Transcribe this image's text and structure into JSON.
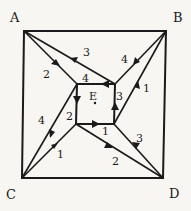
{
  "diagram": {
    "vertices": {
      "A": {
        "label": "A",
        "x": 24,
        "y": 31,
        "label_x": 10,
        "label_y": 22
      },
      "B": {
        "label": "B",
        "x": 166,
        "y": 31,
        "label_x": 173,
        "label_y": 22
      },
      "C": {
        "label": "C",
        "x": 22,
        "y": 178,
        "label_x": 6,
        "label_y": 199
      },
      "D": {
        "label": "D",
        "x": 163,
        "y": 178,
        "label_x": 169,
        "label_y": 198
      },
      "E": {
        "label": "E",
        "x": 95,
        "y": 103,
        "label_x": 89,
        "label_y": 100
      }
    },
    "inner_square": {
      "tl": [
        77,
        84
      ],
      "tr": [
        115,
        84
      ],
      "br": [
        114,
        124
      ],
      "bl": [
        76,
        124
      ]
    },
    "edge_labels": [
      {
        "text": "3",
        "x": 83,
        "y": 56
      },
      {
        "text": "2",
        "x": 43,
        "y": 78
      },
      {
        "text": "4",
        "x": 82,
        "y": 82
      },
      {
        "text": "4",
        "x": 121,
        "y": 63
      },
      {
        "text": "1",
        "x": 143,
        "y": 92
      },
      {
        "text": "3",
        "x": 116,
        "y": 100
      },
      {
        "text": "2",
        "x": 66,
        "y": 120
      },
      {
        "text": "4",
        "x": 38,
        "y": 124
      },
      {
        "text": "1",
        "x": 102,
        "y": 135
      },
      {
        "text": "3",
        "x": 136,
        "y": 142
      },
      {
        "text": "1",
        "x": 57,
        "y": 158
      },
      {
        "text": "2",
        "x": 112,
        "y": 165
      }
    ],
    "point_E": {
      "x": 95,
      "y": 103
    }
  }
}
